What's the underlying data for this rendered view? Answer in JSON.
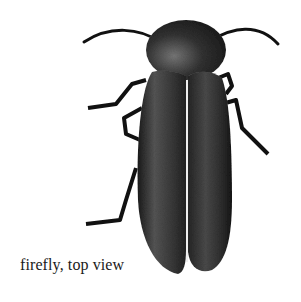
{
  "illustration": {
    "subject": "firefly",
    "caption": "firefly, top view",
    "colors": {
      "body": "#1c1c1c",
      "highlight": "#6a6a6a",
      "background": "#ffffff"
    }
  }
}
